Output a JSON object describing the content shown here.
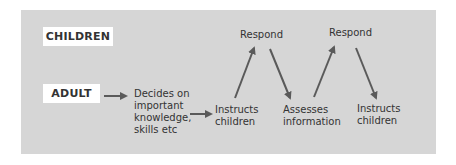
{
  "diagram": {
    "type": "flow",
    "colors": {
      "panel_background": "#d6d6d6",
      "box_background": "#ffffff",
      "text": "#333333",
      "arrow": "#5a5a5a"
    },
    "lanes": {
      "children_label": "CHILDREN",
      "adult_label": "ADULT"
    },
    "nodes": {
      "decides": {
        "lines": [
          "Decides on",
          "important",
          "knowledge,",
          "skills etc"
        ]
      },
      "instructs_1": {
        "lines": [
          "Instructs",
          "children"
        ]
      },
      "respond_1": {
        "label": "Respond"
      },
      "assesses": {
        "lines": [
          "Assesses",
          "information"
        ]
      },
      "respond_2": {
        "label": "Respond"
      },
      "instructs_2": {
        "lines": [
          "Instructs",
          "children"
        ]
      }
    },
    "edges": [
      {
        "from": "ADULT",
        "to": "Decides on important knowledge, skills etc"
      },
      {
        "from": "Decides on important knowledge, skills etc",
        "to": "Instructs children"
      },
      {
        "from": "Instructs children",
        "to": "Respond"
      },
      {
        "from": "Respond",
        "to": "Assesses information"
      },
      {
        "from": "Assesses information",
        "to": "Respond"
      },
      {
        "from": "Respond",
        "to": "Instructs children"
      }
    ]
  }
}
